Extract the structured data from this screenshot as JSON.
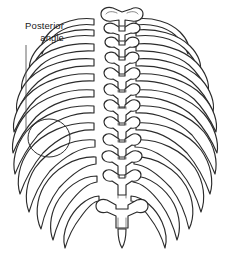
{
  "figure": {
    "background_color": "#ffffff",
    "line_color": "#2b2b2b",
    "text_color": "#1a1a1a",
    "width": 230,
    "height": 259
  },
  "annotation": {
    "label_line_1": "Posterior",
    "label_line_2": "angle",
    "leader": {
      "x": 26,
      "y_start": 45,
      "y_end": 132
    },
    "highlight_circle": {
      "cx": 49,
      "cy": 138,
      "rx": 21,
      "ry": 19
    }
  },
  "anatomy": {
    "rib_pairs": 12,
    "vertebrae_visible": 12,
    "structures": [
      "thoracic-vertebrae",
      "ribs-left",
      "ribs-right",
      "spinous-processes",
      "transverse-processes",
      "costal-angles"
    ]
  }
}
